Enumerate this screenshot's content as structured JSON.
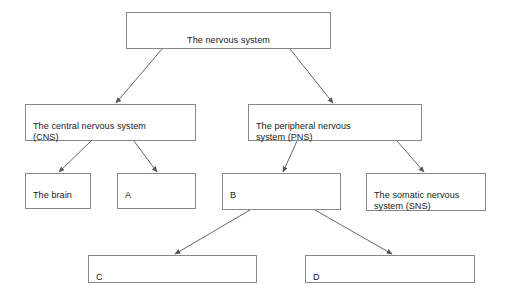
{
  "diagram": {
    "canvas": {
      "width": 510,
      "height": 295,
      "background": "#ffffff"
    },
    "style": {
      "box_border_color": "#878787",
      "box_fill": "#ffffff",
      "text_color": "#1a1a1a",
      "arrow_color": "#555555"
    },
    "nodes": [
      {
        "id": "nervous-system",
        "label": "The nervous system",
        "x": 126,
        "y": 12,
        "w": 205,
        "h": 37,
        "align": "center"
      },
      {
        "id": "cns",
        "label": "The central nervous system\n(CNS)",
        "x": 25,
        "y": 104,
        "w": 171,
        "h": 37,
        "align": "left"
      },
      {
        "id": "pns",
        "label": "The peripheral nervous\nsystem (PNS)",
        "x": 248,
        "y": 104,
        "w": 174,
        "h": 37,
        "align": "left"
      },
      {
        "id": "brain",
        "label": "The brain",
        "x": 25,
        "y": 173,
        "w": 66,
        "h": 36,
        "align": "left"
      },
      {
        "id": "answer-a",
        "label": "A",
        "x": 117,
        "y": 173,
        "w": 79,
        "h": 36,
        "align": "left"
      },
      {
        "id": "answer-b",
        "label": "B",
        "x": 222,
        "y": 173,
        "w": 119,
        "h": 37,
        "align": "left"
      },
      {
        "id": "sns",
        "label": "The somatic nervous\nsystem (SNS)",
        "x": 366,
        "y": 173,
        "w": 120,
        "h": 38,
        "align": "left"
      },
      {
        "id": "answer-c",
        "label": "C",
        "x": 88,
        "y": 255,
        "w": 169,
        "h": 28,
        "align": "left"
      },
      {
        "id": "answer-d",
        "label": "D",
        "x": 305,
        "y": 255,
        "w": 170,
        "h": 28,
        "align": "left"
      }
    ],
    "edges": [
      {
        "id": "edge-nervous-to-cns",
        "from": "nervous-system",
        "to": "cns",
        "x1": 162,
        "y1": 49,
        "x2": 116,
        "y2": 103
      },
      {
        "id": "edge-nervous-to-pns",
        "from": "nervous-system",
        "to": "pns",
        "x1": 290,
        "y1": 49,
        "x2": 333,
        "y2": 103
      },
      {
        "id": "edge-cns-to-brain",
        "from": "cns",
        "to": "brain",
        "x1": 91,
        "y1": 141,
        "x2": 59,
        "y2": 172
      },
      {
        "id": "edge-cns-to-a",
        "from": "cns",
        "to": "answer-a",
        "x1": 134,
        "y1": 141,
        "x2": 157,
        "y2": 172
      },
      {
        "id": "edge-pns-to-b",
        "from": "pns",
        "to": "answer-b",
        "x1": 297,
        "y1": 141,
        "x2": 283,
        "y2": 172
      },
      {
        "id": "edge-pns-to-sns",
        "from": "pns",
        "to": "sns",
        "x1": 397,
        "y1": 141,
        "x2": 424,
        "y2": 172
      },
      {
        "id": "edge-b-to-c",
        "from": "answer-b",
        "to": "answer-c",
        "x1": 250,
        "y1": 210,
        "x2": 175,
        "y2": 254
      },
      {
        "id": "edge-b-to-d",
        "from": "answer-b",
        "to": "answer-d",
        "x1": 315,
        "y1": 210,
        "x2": 392,
        "y2": 254
      }
    ]
  }
}
